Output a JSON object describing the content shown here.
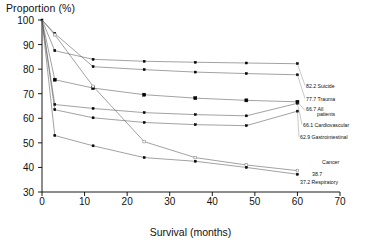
{
  "chart_data": {
    "type": "line",
    "title": "",
    "ylabel": "Proportion (%)",
    "xlabel": "Survival (months)",
    "xlim": [
      0,
      70
    ],
    "ylim": [
      30,
      100
    ],
    "xticks": [
      0,
      10,
      20,
      30,
      40,
      50,
      60,
      70
    ],
    "yticks": [
      30,
      40,
      50,
      60,
      70,
      80,
      90,
      100
    ],
    "grid": false,
    "legend_position": "right-endpoint-labels",
    "x": [
      0,
      3,
      12,
      24,
      36,
      48,
      60
    ],
    "series": [
      {
        "name": "Suicide",
        "marker": "filled-square-small",
        "endpoint_value": "82.2",
        "values": [
          100,
          87.5,
          84.0,
          83.2,
          82.8,
          82.5,
          82.2
        ]
      },
      {
        "name": "Trauma",
        "marker": "filled-square-small",
        "endpoint_value": "77.7",
        "values": [
          100,
          94.5,
          81.0,
          79.8,
          78.8,
          78.2,
          77.7
        ]
      },
      {
        "name": "All patients",
        "marker": "filled-square-large",
        "endpoint_value": "66.7",
        "values": [
          100,
          75.7,
          72.3,
          69.6,
          68.2,
          67.3,
          66.7
        ]
      },
      {
        "name": "Cardiovascular",
        "marker": "filled-square-small",
        "endpoint_value": "66.1",
        "values": [
          100,
          65.6,
          64.0,
          62.3,
          61.5,
          61.0,
          66.1
        ]
      },
      {
        "name": "Gastrointestinal",
        "marker": "filled-square-small",
        "endpoint_value": "62.9",
        "values": [
          100,
          63.5,
          60.2,
          58.3,
          57.4,
          57.0,
          62.9
        ]
      },
      {
        "name": "Cancer",
        "marker": "hollow-square",
        "endpoint_value": "38.7",
        "values": [
          100,
          94.0,
          73.0,
          50.5,
          44.0,
          41.0,
          38.7
        ]
      },
      {
        "name": "Respiratory",
        "marker": "filled-square-small",
        "endpoint_value": "37.2",
        "values": [
          100,
          53.0,
          48.8,
          44.0,
          42.5,
          40.0,
          37.2
        ]
      }
    ],
    "endpoint_labels": [
      {
        "value": "82.2",
        "name": "Suicide"
      },
      {
        "value": "77.7",
        "name": "Trauma"
      },
      {
        "value": "66.7",
        "name": "All",
        "name2": "patients"
      },
      {
        "value": "66.1",
        "name": "Cardiovascular"
      },
      {
        "value": "62.9",
        "name": "Gastrointestinal"
      },
      {
        "value": "38.7",
        "name": "Cancer"
      },
      {
        "value": "37.2",
        "name": "Respiratory"
      }
    ],
    "axis_color": "#000000",
    "line_color": "#555555",
    "marker_color": "#000000"
  }
}
